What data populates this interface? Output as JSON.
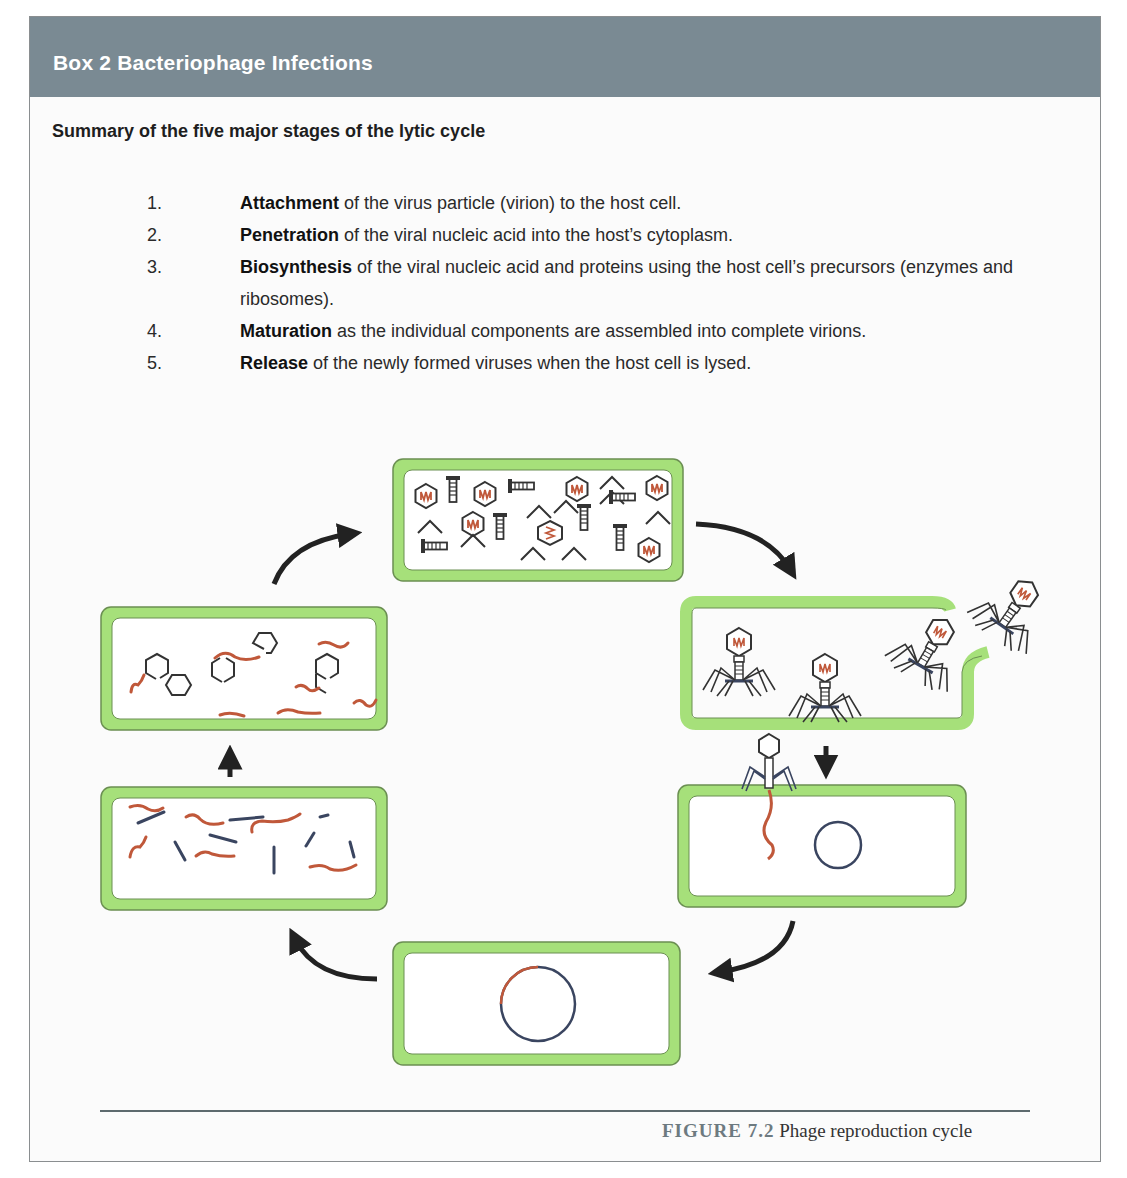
{
  "box": {
    "title": "Box 2 Bacteriophage Infections",
    "subtitle": "Summary of the five major stages of the lytic cycle",
    "steps": [
      {
        "number": "1.",
        "term": "Attachment",
        "rest": " of the virus particle (virion) to the host cell."
      },
      {
        "number": "2.",
        "term": "Penetration",
        "rest": " of the viral nucleic acid into the host’s cytoplasm."
      },
      {
        "number": "3.",
        "term": "Biosynthesis",
        "rest": " of the viral nucleic acid and proteins using the host cell’s precursors (enzymes and ribosomes)."
      },
      {
        "number": "4.",
        "term": "Maturation",
        "rest": " as the individual components are assembled into complete virions."
      },
      {
        "number": "5.",
        "term": "Release",
        "rest": " of the newly formed viruses when the host cell is lysed."
      }
    ]
  },
  "figure": {
    "label": "FIGURE 7.2",
    "caption": "Phage reproduction cycle",
    "stages": [
      {
        "id": "penetration",
        "description": "Phage attached to cell injecting DNA; circular host chromosome"
      },
      {
        "id": "integration",
        "description": "Circular chromosome with viral segment"
      },
      {
        "id": "biosynthesis",
        "description": "Viral DNA strands and protein fragments"
      },
      {
        "id": "assembly",
        "description": "Empty capsid heads and viral DNA"
      },
      {
        "id": "maturation",
        "description": "Heads filled with DNA, tails and tail fibers"
      },
      {
        "id": "release",
        "description": "Complete phages exiting lysed cell"
      }
    ]
  },
  "colors": {
    "header_bg": "#7a8a93",
    "cell_wall": "#a6e07a",
    "cell_border": "#5a8a40",
    "dna": "#c0583a",
    "protein": "#3a4560",
    "arrow": "#222222"
  }
}
